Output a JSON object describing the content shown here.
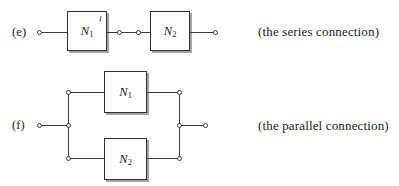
{
  "figure": {
    "title_series": "(the series connection)",
    "title_parallel": "(the parallel connection)",
    "ink_color": "#3a3a3a",
    "box_border_color": "#2e2e2e",
    "background": "#ffffff"
  },
  "series": {
    "part_label": "(e)",
    "caption": "(the series connection)",
    "blocks": [
      {
        "name": "N",
        "subscript": "1"
      },
      {
        "name": "N",
        "subscript": "2"
      }
    ],
    "terminals": 4,
    "terminal_name": "terminal-node"
  },
  "parallel": {
    "part_label": "(f)",
    "caption": "(the parallel connection)",
    "blocks": [
      {
        "name": "N",
        "subscript": "1"
      },
      {
        "name": "N",
        "subscript": "2"
      }
    ],
    "terminals": 8,
    "terminal_name": "terminal-node"
  }
}
